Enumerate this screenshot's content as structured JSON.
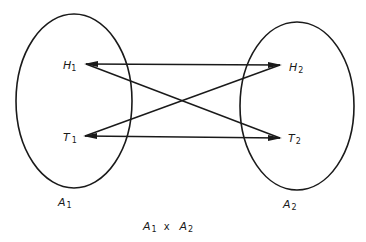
{
  "diagram": {
    "type": "set mapping / cartesian product",
    "sets": [
      {
        "id": "A1",
        "label": "A",
        "sub": "1",
        "elements": [
          {
            "id": "H1",
            "label": "H",
            "sub": "1"
          },
          {
            "id": "T1",
            "label": "T",
            "sub": "1"
          }
        ]
      },
      {
        "id": "A2",
        "label": "A",
        "sub": "2",
        "elements": [
          {
            "id": "H2",
            "label": "H",
            "sub": "2"
          },
          {
            "id": "T2",
            "label": "T",
            "sub": "2"
          }
        ]
      }
    ],
    "edges": [
      {
        "from": "H1",
        "to": "H2"
      },
      {
        "from": "H1",
        "to": "T2"
      },
      {
        "from": "T1",
        "to": "H2"
      },
      {
        "from": "T1",
        "to": "T2"
      }
    ],
    "caption": {
      "left": "A",
      "left_sub": "1",
      "op": "x",
      "right": "A",
      "right_sub": "2"
    }
  }
}
